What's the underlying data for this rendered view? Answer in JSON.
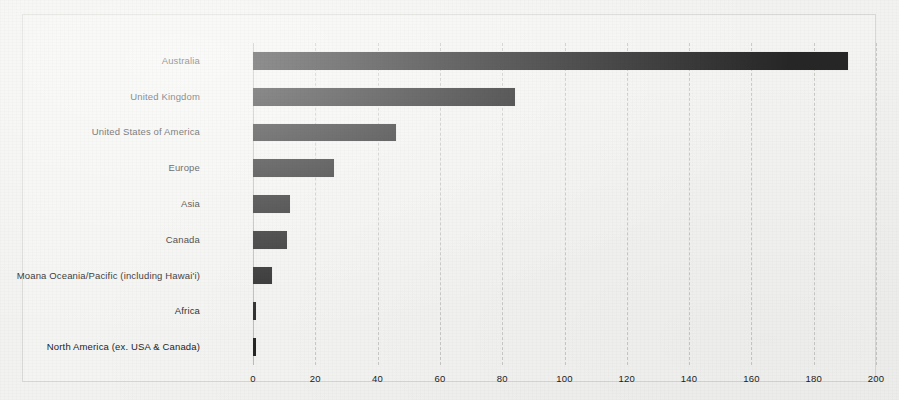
{
  "chart_data": {
    "type": "bar",
    "orientation": "horizontal",
    "title": "",
    "subtitle": "",
    "xlabel": "",
    "ylabel": "",
    "categories": [
      "Australia",
      "United Kingdom",
      "United States of America",
      "Europe",
      "Asia",
      "Canada",
      "Moana Oceania/Pacific (including Hawai'i)",
      "Africa",
      "North America (ex. USA & Canada)"
    ],
    "values": [
      191,
      84,
      46,
      26,
      12,
      11,
      6,
      1,
      1
    ],
    "xlim": [
      0,
      200
    ],
    "xticks": [
      0,
      20,
      40,
      60,
      80,
      100,
      120,
      140,
      160,
      180,
      200
    ],
    "xtick_labels": [
      "0",
      "20",
      "40",
      "60",
      "80",
      "100",
      "120",
      "140",
      "160",
      "180",
      "200"
    ],
    "grid": "vertical-dashed",
    "legend": "none",
    "bar_color": "#262626",
    "background_color": "#f2f2f0",
    "gridline_color": "#c9c9c5"
  },
  "chart": {
    "name": "horizontal-bar-chart"
  }
}
